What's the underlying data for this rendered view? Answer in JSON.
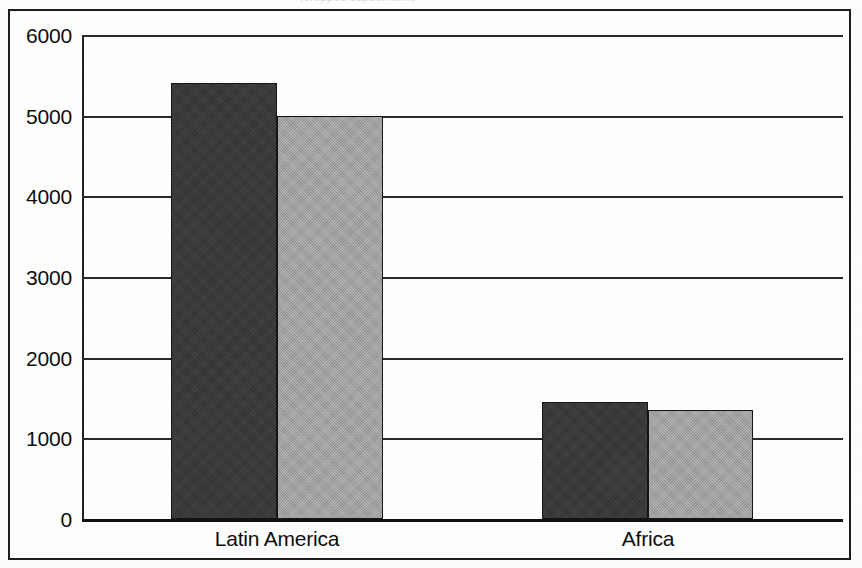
{
  "figure": {
    "top_sliver_ghost_text": "(cropped caption text)",
    "frame_color": "#1d1d1d",
    "background_color": "#ffffff"
  },
  "chart_data": {
    "type": "bar",
    "title": "",
    "subtitle": "",
    "xlabel": "",
    "ylabel": "",
    "categories": [
      "Latin America",
      "Africa"
    ],
    "series": [
      {
        "name": "Series 1",
        "color": "#3b3b3b",
        "values": [
          5400,
          1450
        ]
      },
      {
        "name": "Series 2",
        "color": "#a3a3a3",
        "values": [
          5000,
          1350
        ]
      }
    ],
    "ylim": [
      0,
      6000
    ],
    "ytick_values": [
      0,
      1000,
      2000,
      3000,
      4000,
      5000,
      6000
    ],
    "ytick_labels": [
      "0",
      "1000",
      "2000",
      "3000",
      "4000",
      "5000",
      "6000"
    ],
    "grid": true,
    "grid_axis": "y",
    "legend": false,
    "legend_position": "none",
    "annotations": []
  }
}
